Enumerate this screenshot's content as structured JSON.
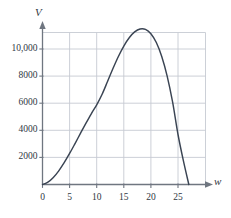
{
  "chart_data": {
    "type": "line",
    "title": "",
    "subtitle": "",
    "xlabel": "w",
    "ylabel": "V",
    "xlim": [
      -1,
      30
    ],
    "ylim": [
      0,
      12000
    ],
    "grid": true,
    "legend": null,
    "annotations": [],
    "x_ticks": [
      0,
      5,
      10,
      15,
      20,
      25
    ],
    "x_tick_labels": [
      "0",
      "5",
      "10",
      "15",
      "20",
      "25"
    ],
    "y_ticks": [
      2000,
      4000,
      6000,
      8000,
      10000
    ],
    "y_tick_labels": [
      "2000",
      "4000",
      "6000",
      "8000",
      "10,000"
    ],
    "series": [
      {
        "name": "V(w)",
        "color": "#3a4453",
        "x": [
          0,
          1,
          2,
          3,
          4,
          5,
          6,
          7,
          8,
          9,
          10,
          11,
          12,
          13,
          14,
          15,
          16,
          17,
          18,
          19,
          20,
          21,
          22,
          23,
          24,
          25,
          26,
          27
        ],
        "y": [
          0,
          175,
          520,
          1010,
          1610,
          2290,
          3020,
          3770,
          4510,
          5220,
          5880,
          6660,
          7600,
          8560,
          9450,
          10220,
          10830,
          11260,
          11480,
          11450,
          11130,
          10480,
          9450,
          8000,
          6090,
          3690,
          1740,
          0
        ]
      }
    ],
    "curve_notes": {
      "start_point": "origin (0, 0)",
      "peak_x": 18,
      "peak_y": 11480,
      "right_zero_x": 27
    }
  },
  "axes": {
    "y_label": "V",
    "x_label": "w"
  },
  "colors": {
    "curve": "#3a4453",
    "grid": "#c6cbd3",
    "axis": "#6f7680",
    "text": "#2f3742",
    "background": "#ffffff"
  }
}
